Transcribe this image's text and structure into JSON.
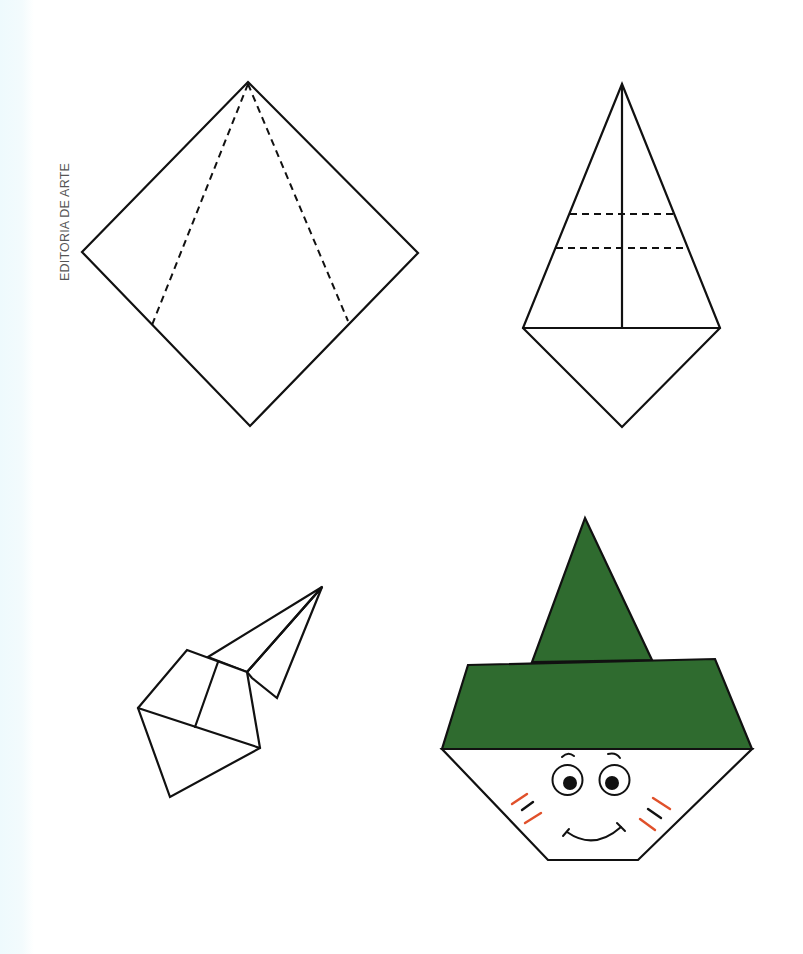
{
  "credit": {
    "text": "EDITORIA DE ARTE"
  },
  "colors": {
    "outline": "#111111",
    "hat_green": "#2f6b2f",
    "blush_red": "#e0502a",
    "background_strip": "#eefafd",
    "credit_gray": "#555555"
  },
  "figures": [
    {
      "step": 1,
      "description": "Square paper as diamond with two dashed fold lines from top vertex",
      "outline": "248,82 418,253 250,426 82,252",
      "dashed_folds": [
        {
          "from": "248,82",
          "to": "152,325"
        },
        {
          "from": "248,82",
          "to": "348,321"
        }
      ]
    },
    {
      "step": 2,
      "description": "Kite shape with vertical center line and two dashed horizontal folds",
      "outline": "622,84 720,328 622,427 523,328",
      "center_line": {
        "from": "622,84",
        "to": "622,328"
      },
      "base_line": {
        "from": "523,328",
        "to": "720,328"
      },
      "dashed_folds": [
        {
          "from": "570,214",
          "to": "675,214"
        },
        {
          "from": "556,248",
          "to": "687,248"
        }
      ]
    },
    {
      "step": 3,
      "description": "Folded paper rotated with cone point extended upward-right"
    },
    {
      "step": 4,
      "description": "Finished origami face with green pointed hat",
      "hat_color": "#2f6b2f",
      "face": {
        "eyes": 2,
        "eyebrows": 2,
        "cheek_marks_per_side": 3,
        "mouth": "smile"
      }
    }
  ]
}
